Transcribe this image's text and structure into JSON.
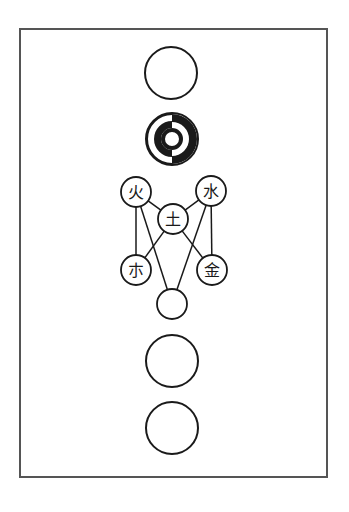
{
  "diagram": {
    "frame": {
      "x": 20,
      "y": 29,
      "width": 307,
      "height": 448,
      "stroke": "#555555"
    },
    "ink_color": "#1a1a1a",
    "large_circles": [
      {
        "id": "top-circle",
        "cx": 171,
        "cy": 73,
        "r": 26
      },
      {
        "id": "lower-circle-1",
        "cx": 172,
        "cy": 361,
        "r": 26
      },
      {
        "id": "lower-circle-2",
        "cx": 172,
        "cy": 428,
        "r": 26
      }
    ],
    "concentric_symbol": {
      "cx": 172,
      "cy": 139,
      "r": 26
    },
    "element_nodes": [
      {
        "id": "fire",
        "label": "火",
        "cx": 136,
        "cy": 192,
        "r": 15
      },
      {
        "id": "water",
        "label": "水",
        "cx": 211,
        "cy": 191,
        "r": 15
      },
      {
        "id": "earth",
        "label": "土",
        "cx": 173,
        "cy": 219,
        "r": 15
      },
      {
        "id": "wood",
        "label": "朩",
        "cx": 136,
        "cy": 270,
        "r": 15
      },
      {
        "id": "metal",
        "label": "金",
        "cx": 212,
        "cy": 270,
        "r": 15
      },
      {
        "id": "base",
        "label": "",
        "cx": 172,
        "cy": 304,
        "r": 15
      }
    ],
    "edges": [
      [
        "fire",
        "earth"
      ],
      [
        "water",
        "earth"
      ],
      [
        "fire",
        "wood"
      ],
      [
        "water",
        "metal"
      ],
      [
        "fire",
        "base"
      ],
      [
        "water",
        "base"
      ],
      [
        "earth",
        "wood"
      ],
      [
        "earth",
        "metal"
      ]
    ]
  }
}
